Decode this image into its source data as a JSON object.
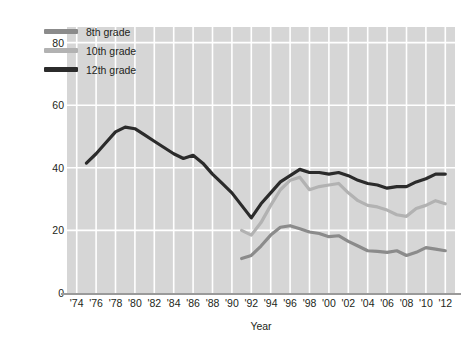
{
  "chart_data": {
    "type": "line",
    "title": "",
    "xlabel": "Year",
    "ylabel": "Trends in the percent of U.S. adolescents  who have used an illicit drug in the last 12 months",
    "ylabel_lines": [
      "Trends in the percent of U.S. adolescents  who have",
      "used an illicit drug in the last 12 months"
    ],
    "xlim": [
      1973,
      2013
    ],
    "ylim": [
      0,
      85
    ],
    "yticks": [
      0,
      20,
      40,
      60,
      80
    ],
    "xticks": [
      1974,
      1976,
      1978,
      1980,
      1982,
      1984,
      1986,
      1988,
      1990,
      1992,
      1994,
      1996,
      1998,
      2000,
      2002,
      2004,
      2006,
      2008,
      2010,
      2012
    ],
    "xtick_labels": [
      "'74",
      "'76",
      "'78",
      "'80",
      "'82",
      "'84",
      "'86",
      "'88",
      "'90",
      "'92",
      "'94",
      "'96",
      "'98",
      "'00",
      "'02",
      "'04",
      "'06",
      "'08",
      "'10",
      "'12"
    ],
    "grid": true,
    "grid_color": "#ffffff",
    "plot_background": "#d6d6d6",
    "legend_position": "top-left",
    "series": [
      {
        "name": "8th grade",
        "color": "#8b8b8b",
        "x": [
          1991,
          1992,
          1993,
          1994,
          1995,
          1996,
          1997,
          1998,
          1999,
          2000,
          2001,
          2002,
          2003,
          2004,
          2005,
          2006,
          2007,
          2008,
          2009,
          2010,
          2011,
          2012
        ],
        "values": [
          11.0,
          12.0,
          15.0,
          18.5,
          21.0,
          21.5,
          20.5,
          19.5,
          19.0,
          18.0,
          18.3,
          16.5,
          15.0,
          13.5,
          13.3,
          13.0,
          13.5,
          12.0,
          13.0,
          14.5,
          14.0,
          13.5
        ]
      },
      {
        "name": "10th grade",
        "color": "#b2b2b2",
        "x": [
          1991,
          1992,
          1993,
          1994,
          1995,
          1996,
          1997,
          1998,
          1999,
          2000,
          2001,
          2002,
          2003,
          2004,
          2005,
          2006,
          2007,
          2008,
          2009,
          2010,
          2011,
          2012
        ],
        "values": [
          20.0,
          18.5,
          22.5,
          28.0,
          33.0,
          36.0,
          37.0,
          33.0,
          34.0,
          34.5,
          35.0,
          32.0,
          29.5,
          28.0,
          27.5,
          26.5,
          25.0,
          24.5,
          27.0,
          28.0,
          29.5,
          28.5
        ]
      },
      {
        "name": "12th grade",
        "color": "#2b2b2b",
        "x": [
          1975,
          1976,
          1977,
          1978,
          1979,
          1980,
          1981,
          1982,
          1983,
          1984,
          1985,
          1986,
          1987,
          1988,
          1989,
          1990,
          1991,
          1992,
          1993,
          1994,
          1995,
          1996,
          1997,
          1998,
          1999,
          2000,
          2001,
          2002,
          2003,
          2004,
          2005,
          2006,
          2007,
          2008,
          2009,
          2010,
          2011,
          2012
        ],
        "values": [
          41.5,
          44.5,
          48.0,
          51.5,
          53.0,
          52.5,
          50.5,
          48.5,
          46.5,
          44.5,
          43.0,
          44.0,
          41.5,
          38.0,
          35.0,
          32.0,
          28.0,
          24.0,
          28.5,
          32.0,
          35.5,
          37.5,
          39.5,
          38.5,
          38.5,
          38.0,
          38.5,
          37.5,
          36.0,
          35.0,
          34.5,
          33.5,
          34.0,
          34.0,
          35.5,
          36.5,
          38.0,
          38.0
        ]
      }
    ]
  },
  "legend": {
    "items": [
      {
        "label": "8th grade",
        "color": "#8b8b8b"
      },
      {
        "label": "10th grade",
        "color": "#b2b2b2"
      },
      {
        "label": "12th grade",
        "color": "#2b2b2b"
      }
    ]
  }
}
